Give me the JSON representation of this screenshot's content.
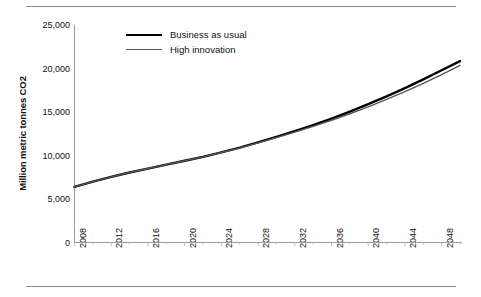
{
  "chart_data": {
    "type": "line",
    "title": "",
    "xlabel": "",
    "ylabel": "Million metric tonnes CO2",
    "xlim": [
      2008,
      2050
    ],
    "ylim": [
      0,
      25000
    ],
    "grid": false,
    "legend_position": "top-center",
    "x_tick_labels": [
      "2008",
      "2012",
      "2016",
      "2020",
      "2024",
      "2028",
      "2032",
      "2036",
      "2040",
      "2044",
      "2048"
    ],
    "x_tick_values": [
      2008,
      2012,
      2016,
      2020,
      2024,
      2028,
      2032,
      2036,
      2040,
      2044,
      2048
    ],
    "x_minor_tick_interval": 2,
    "y_tick_labels": [
      "25,000",
      "20,000",
      "15,000",
      "10,000",
      "5,000",
      "0"
    ],
    "y_tick_values": [
      25000,
      20000,
      15000,
      10000,
      5000,
      0
    ],
    "x": [
      2008,
      2010,
      2012,
      2014,
      2016,
      2018,
      2020,
      2022,
      2024,
      2026,
      2028,
      2030,
      2032,
      2034,
      2036,
      2038,
      2040,
      2042,
      2044,
      2046,
      2048,
      2050
    ],
    "series": [
      {
        "name": "Business as usual",
        "color": "#000000",
        "width": 2.4,
        "values": [
          6400,
          7000,
          7550,
          8050,
          8500,
          8950,
          9400,
          9850,
          10350,
          10900,
          11500,
          12150,
          12800,
          13500,
          14250,
          15050,
          15900,
          16800,
          17750,
          18750,
          19800,
          20850
        ]
      },
      {
        "name": "High innovation",
        "color": "#585858",
        "width": 1.4,
        "values": [
          6400,
          7000,
          7550,
          8050,
          8500,
          8950,
          9400,
          9850,
          10350,
          10880,
          11450,
          12050,
          12680,
          13340,
          14050,
          14800,
          15600,
          16450,
          17350,
          18300,
          19300,
          20350
        ]
      }
    ]
  },
  "legend": {
    "items": [
      {
        "label": "Business as usual",
        "style": "bau"
      },
      {
        "label": "High innovation",
        "style": "hi"
      }
    ]
  },
  "axis": {
    "y_title": "Million metric tonnes CO2"
  },
  "colors": {
    "axis_line": "#9a9a9a",
    "rule": "#8c8c8c",
    "text": "#111111",
    "series_bau": "#000000",
    "series_high_innovation": "#585858"
  }
}
